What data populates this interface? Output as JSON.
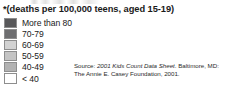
{
  "legend": {
    "title": "*(deaths per 100,000 teens, aged 15-19)",
    "items": [
      {
        "label": "More than 80",
        "color": "#58585a",
        "range_min": 80,
        "range_max": null
      },
      {
        "label": "70-79",
        "color": "#6e6e70",
        "range_min": 70,
        "range_max": 79
      },
      {
        "label": "60-69",
        "color": "#d2d2d2",
        "range_min": 60,
        "range_max": 69
      },
      {
        "label": "50-59",
        "color": "#c4c4c4",
        "range_min": 50,
        "range_max": 59
      },
      {
        "label": "40-49",
        "color": "#b2b2b2",
        "range_min": 40,
        "range_max": 49
      },
      {
        "label": "< 40",
        "color": "#ffffff",
        "range_min": null,
        "range_max": 40
      }
    ]
  },
  "source": {
    "prefix": "Source: ",
    "publication": "2001 Kids Count Data Sheet",
    "line1_suffix": ". Baltimore, MD:",
    "line2": "The Annie E. Casey Foundation, 2001."
  },
  "chart_data": {
    "type": "table",
    "title": "*(deaths per 100,000 teens, aged 15-19)",
    "legend_position": "left",
    "categories": [
      "More than 80",
      "70-79",
      "60-69",
      "50-59",
      "40-49",
      "< 40"
    ],
    "values": [
      80,
      74.5,
      64.5,
      54.5,
      44.5,
      39
    ],
    "colors": [
      "#58585a",
      "#6e6e70",
      "#d2d2d2",
      "#c4c4c4",
      "#b2b2b2",
      "#ffffff"
    ],
    "xlabel": "",
    "ylabel": "deaths per 100,000 teens, aged 15-19",
    "annotations": [
      "Source: 2001 Kids Count Data Sheet. Baltimore, MD: The Annie E. Casey Foundation, 2001."
    ]
  }
}
